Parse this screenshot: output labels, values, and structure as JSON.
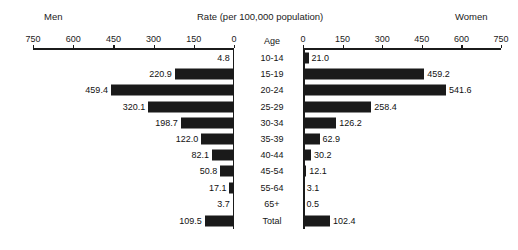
{
  "header": {
    "left_group_label": "Men",
    "right_group_label": "Women",
    "title": "Rate (per 100,000 population)",
    "age_column_header": "Age"
  },
  "axes": {
    "left_ticks": [
      "750",
      "600",
      "450",
      "300",
      "150",
      "0"
    ],
    "right_ticks": [
      "0",
      "150",
      "300",
      "450",
      "600",
      "750"
    ],
    "max": 750,
    "min": 0,
    "grid": false
  },
  "chart_data": {
    "type": "bar",
    "title": "Rate (per 100,000 population)",
    "xlabel": "Rate (per 100,000 population)",
    "ylabel": "Age",
    "xlim": [
      0,
      750
    ],
    "grid": false,
    "legend_position": "top",
    "orientation": "horizontal",
    "layout": "population-pyramid",
    "categories": [
      "10-14",
      "15-19",
      "20-24",
      "25-29",
      "30-34",
      "35-39",
      "40-44",
      "45-54",
      "55-64",
      "65+",
      "Total"
    ],
    "series": [
      {
        "name": "Men",
        "side": "left",
        "values": [
          4.8,
          220.9,
          459.4,
          320.1,
          198.7,
          122.0,
          82.1,
          50.8,
          17.1,
          3.7,
          109.5
        ],
        "labels": [
          "4.8",
          "220.9",
          "459.4",
          "320.1",
          "198.7",
          "122.0",
          "82.1",
          "50.8",
          "17.1",
          "3.7",
          "109.5"
        ]
      },
      {
        "name": "Women",
        "side": "right",
        "values": [
          21.0,
          459.2,
          541.6,
          258.4,
          126.2,
          62.9,
          30.2,
          12.1,
          3.1,
          0.5,
          102.4
        ],
        "labels": [
          "21.0",
          "459.2",
          "541.6",
          "258.4",
          "126.2",
          "62.9",
          "30.2",
          "12.1",
          "3.1",
          "0.5",
          "102.4"
        ]
      }
    ],
    "bar_color": "#1a1a1a"
  },
  "colors": {
    "bar": "#1a1a1a",
    "axis": "#1b1b1b",
    "text": "#111111",
    "background": "#ffffff"
  }
}
